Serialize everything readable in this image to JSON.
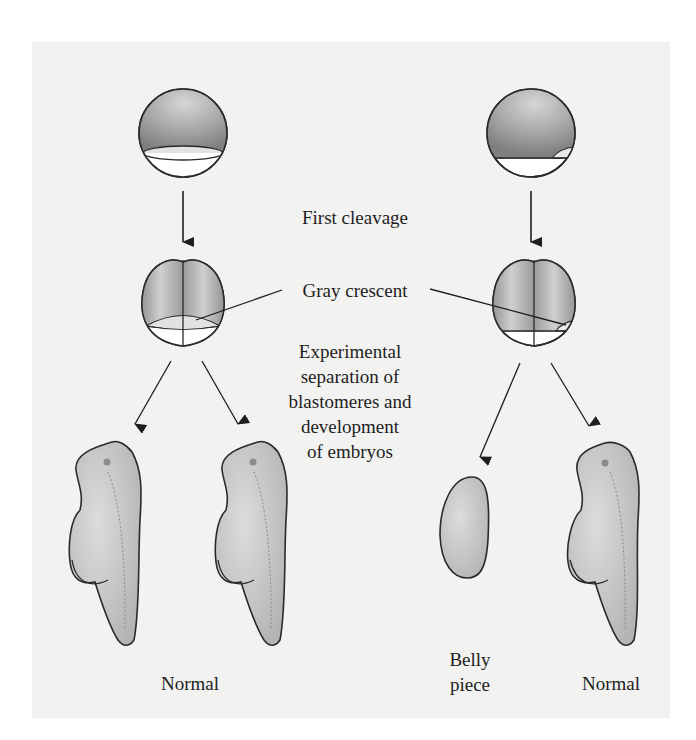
{
  "figure": {
    "labels": {
      "first_cleavage": "First cleavage",
      "gray_crescent": "Gray crescent",
      "experimental_lines": [
        "Experimental",
        "separation of",
        "blastomeres and",
        "development",
        "of embryos"
      ],
      "outcome_left_pair": "Normal",
      "belly_piece_lines": [
        "Belly",
        "piece"
      ],
      "outcome_right": "Normal"
    },
    "panels": {
      "left": {
        "zygote": "egg with gray crescent bisected by cleavage plane",
        "two_cell": "2-cell stage, each blastomere receives gray crescent",
        "results": [
          "Normal",
          "Normal"
        ]
      },
      "right": {
        "zygote": "egg with gray crescent on one side",
        "two_cell": "2-cell stage, gray crescent only in right blastomere",
        "results": [
          "Belly piece",
          "Normal"
        ]
      }
    },
    "colors": {
      "paper": "#f2f2f1",
      "outline": "#2a2a2a",
      "animal_hemisphere": "#9a9a9a",
      "vegetal": "#ffffff",
      "crescent": "#e2e2e2",
      "embryo": "#c9c9c9",
      "text": "#1e1e1e"
    }
  }
}
